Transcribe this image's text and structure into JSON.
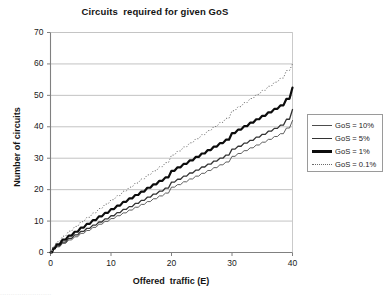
{
  "chart_data": {
    "type": "line",
    "title": "Circuits  required for given GoS",
    "xlabel": "Offered  traffic (E)",
    "ylabel": "Number of circuits",
    "xlim": [
      0,
      40
    ],
    "ylim": [
      0,
      70
    ],
    "xticks": [
      "0",
      "10",
      "20",
      "30",
      "40"
    ],
    "yticks": [
      "0",
      "10",
      "20",
      "30",
      "40",
      "50",
      "60",
      "70"
    ],
    "grid": "horizontal",
    "legend_position": "right",
    "x": [
      0,
      1,
      2,
      3,
      4,
      5,
      6,
      7,
      8,
      9,
      10,
      11,
      12,
      13,
      14,
      15,
      16,
      17,
      18,
      19,
      20,
      21,
      22,
      23,
      24,
      25,
      26,
      27,
      28,
      29,
      30,
      31,
      32,
      33,
      34,
      35,
      36,
      37,
      38,
      39,
      40
    ],
    "series": [
      {
        "name": "GoS = 10%",
        "style": "thin-solid",
        "color": "#4d4d4d",
        "width": 0.9,
        "values": [
          0,
          1,
          2,
          3,
          4,
          5,
          6,
          7,
          8,
          9,
          10,
          11,
          12,
          13,
          14,
          15,
          16,
          17,
          18,
          19,
          20,
          21,
          22,
          23,
          24,
          25,
          26,
          27,
          28,
          29,
          30,
          31,
          32,
          33,
          34,
          35,
          36,
          37,
          38,
          39,
          42
        ]
      },
      {
        "name": "GoS = 5%",
        "style": "medium-solid",
        "color": "#333333",
        "width": 1.3,
        "values": [
          0,
          1,
          2,
          3,
          4,
          5,
          6,
          7,
          8,
          9,
          10,
          11,
          12,
          13,
          14,
          15,
          16,
          17,
          18,
          19,
          20,
          21,
          22,
          23,
          24,
          25,
          26,
          27,
          28,
          29,
          30,
          31,
          32,
          33,
          34,
          35,
          36,
          37,
          38,
          39,
          45.5
        ]
      },
      {
        "name": "GoS = 1%",
        "style": "thick-solid",
        "color": "#0d0d0d",
        "width": 2.2,
        "values": [
          0,
          1,
          2,
          3,
          4,
          5,
          6,
          7,
          8,
          9,
          10,
          11,
          12,
          13,
          14,
          15,
          16,
          17,
          18,
          19,
          20,
          21,
          22,
          23,
          24,
          25,
          26,
          27,
          28,
          29,
          30,
          31,
          32,
          33,
          34,
          35,
          36,
          37,
          38,
          39,
          52.5
        ]
      },
      {
        "name": "GoS = 0.1%",
        "style": "dotted",
        "color": "#6b6b6b",
        "width": 1.0,
        "values": [
          0,
          1,
          2,
          3,
          4,
          5,
          6,
          7,
          8,
          9,
          10,
          11,
          12,
          13,
          14,
          15,
          16,
          17,
          18,
          19,
          20,
          21,
          22,
          23,
          24,
          25,
          26,
          27,
          28,
          29,
          30,
          31,
          32,
          33,
          34,
          35,
          36,
          37,
          38,
          39,
          60
        ]
      }
    ],
    "curves": {
      "GoS = 10%": [
        [
          0,
          0
        ],
        [
          0.5,
          1
        ],
        [
          1,
          1.8
        ],
        [
          2,
          2.9
        ],
        [
          3,
          4
        ],
        [
          4,
          5
        ],
        [
          5,
          6.1
        ],
        [
          6,
          7
        ],
        [
          7,
          8
        ],
        [
          8,
          9
        ],
        [
          9,
          9.9
        ],
        [
          10,
          10.8
        ],
        [
          11,
          11.7
        ],
        [
          12,
          12.6
        ],
        [
          13,
          13.5
        ],
        [
          14,
          14.4
        ],
        [
          15,
          15.3
        ],
        [
          16,
          16.2
        ],
        [
          17,
          17.1
        ],
        [
          18,
          18
        ],
        [
          19,
          18.9
        ],
        [
          20,
          20.8
        ],
        [
          21,
          21.6
        ],
        [
          22,
          22.5
        ],
        [
          23,
          23.4
        ],
        [
          24,
          24.3
        ],
        [
          25,
          25.2
        ],
        [
          26,
          26.1
        ],
        [
          27,
          27
        ],
        [
          28,
          27.9
        ],
        [
          29,
          28.8
        ],
        [
          30,
          30.6
        ],
        [
          31,
          31.5
        ],
        [
          32,
          32.4
        ],
        [
          33,
          33.3
        ],
        [
          34,
          34.2
        ],
        [
          35,
          35.1
        ],
        [
          36,
          36
        ],
        [
          37,
          36.9
        ],
        [
          38,
          37.8
        ],
        [
          39,
          39.6
        ],
        [
          40,
          42
        ]
      ],
      "GoS = 5%": [
        [
          0,
          0
        ],
        [
          0.5,
          1.2
        ],
        [
          1,
          2.1
        ],
        [
          2,
          3.3
        ],
        [
          3,
          4.5
        ],
        [
          4,
          5.6
        ],
        [
          5,
          6.7
        ],
        [
          6,
          7.7
        ],
        [
          7,
          8.7
        ],
        [
          8,
          9.7
        ],
        [
          9,
          10.7
        ],
        [
          10,
          11.7
        ],
        [
          11,
          12.7
        ],
        [
          12,
          13.7
        ],
        [
          13,
          14.6
        ],
        [
          14,
          15.6
        ],
        [
          15,
          16.6
        ],
        [
          16,
          17.6
        ],
        [
          17,
          18.6
        ],
        [
          18,
          19.5
        ],
        [
          19,
          20.5
        ],
        [
          20,
          22.4
        ],
        [
          21,
          23.3
        ],
        [
          22,
          24.3
        ],
        [
          23,
          25.3
        ],
        [
          24,
          26.2
        ],
        [
          25,
          27.2
        ],
        [
          26,
          28.1
        ],
        [
          27,
          29.1
        ],
        [
          28,
          30
        ],
        [
          29,
          31
        ],
        [
          30,
          32.9
        ],
        [
          31,
          33.8
        ],
        [
          32,
          34.8
        ],
        [
          33,
          35.7
        ],
        [
          34,
          36.7
        ],
        [
          35,
          37.6
        ],
        [
          36,
          38.6
        ],
        [
          37,
          39.5
        ],
        [
          38,
          40.5
        ],
        [
          39,
          42.4
        ],
        [
          40,
          45.5
        ]
      ],
      "GoS = 1%": [
        [
          0,
          0
        ],
        [
          0.5,
          1.5
        ],
        [
          1,
          2.6
        ],
        [
          2,
          4.1
        ],
        [
          3,
          5.4
        ],
        [
          4,
          6.6
        ],
        [
          5,
          7.9
        ],
        [
          6,
          9.1
        ],
        [
          7,
          10.3
        ],
        [
          8,
          11.5
        ],
        [
          9,
          12.6
        ],
        [
          10,
          13.8
        ],
        [
          11,
          14.9
        ],
        [
          12,
          16.1
        ],
        [
          13,
          17.2
        ],
        [
          14,
          18.3
        ],
        [
          15,
          19.4
        ],
        [
          16,
          20.6
        ],
        [
          17,
          21.7
        ],
        [
          18,
          22.8
        ],
        [
          19,
          23.9
        ],
        [
          20,
          26
        ],
        [
          21,
          27.1
        ],
        [
          22,
          28.2
        ],
        [
          23,
          29.3
        ],
        [
          24,
          30.4
        ],
        [
          25,
          31.5
        ],
        [
          26,
          32.6
        ],
        [
          27,
          33.7
        ],
        [
          28,
          34.8
        ],
        [
          29,
          35.9
        ],
        [
          30,
          38
        ],
        [
          31,
          39.1
        ],
        [
          32,
          40.2
        ],
        [
          33,
          41.3
        ],
        [
          34,
          42.4
        ],
        [
          35,
          43.5
        ],
        [
          36,
          44.6
        ],
        [
          37,
          45.7
        ],
        [
          38,
          46.8
        ],
        [
          39,
          48.9
        ],
        [
          40,
          52.5
        ]
      ],
      "GoS = 0.1%": [
        [
          0,
          0
        ],
        [
          0.5,
          2
        ],
        [
          1,
          3.4
        ],
        [
          2,
          5.2
        ],
        [
          3,
          6.8
        ],
        [
          4,
          8.3
        ],
        [
          5,
          9.8
        ],
        [
          6,
          11.2
        ],
        [
          7,
          12.6
        ],
        [
          8,
          14
        ],
        [
          9,
          15.4
        ],
        [
          10,
          16.8
        ],
        [
          11,
          18.1
        ],
        [
          12,
          19.5
        ],
        [
          13,
          20.8
        ],
        [
          14,
          22.1
        ],
        [
          15,
          23.4
        ],
        [
          16,
          24.7
        ],
        [
          17,
          26
        ],
        [
          18,
          27.3
        ],
        [
          19,
          28.6
        ],
        [
          20,
          31
        ],
        [
          21,
          32.3
        ],
        [
          22,
          33.6
        ],
        [
          23,
          34.9
        ],
        [
          24,
          36.2
        ],
        [
          25,
          37.5
        ],
        [
          26,
          38.8
        ],
        [
          27,
          40.1
        ],
        [
          28,
          41.4
        ],
        [
          29,
          42.7
        ],
        [
          30,
          45.1
        ],
        [
          31,
          46.4
        ],
        [
          32,
          47.7
        ],
        [
          33,
          49
        ],
        [
          34,
          50.3
        ],
        [
          35,
          51.6
        ],
        [
          36,
          52.9
        ],
        [
          37,
          54.2
        ],
        [
          38,
          55.5
        ],
        [
          39,
          57.9
        ],
        [
          40,
          60
        ]
      ]
    },
    "legend": [
      {
        "label": "GoS = 10%"
      },
      {
        "label": "GoS = 5%"
      },
      {
        "label": "GoS = 1%"
      },
      {
        "label": "GoS = 0.1%"
      }
    ]
  },
  "artifact": {
    "text": "........................"
  }
}
